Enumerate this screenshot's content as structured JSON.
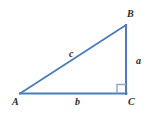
{
  "figure": {
    "type": "right-triangle-diagram",
    "background_color": "#ffffff",
    "stroke_color": "#4a7ebb",
    "label_color": "#2b2b2b",
    "stroke_width": 2,
    "canvas": {
      "width": 158,
      "height": 120
    },
    "vertices": [
      {
        "name": "A",
        "label": "A",
        "x": 20,
        "y": 94
      },
      {
        "name": "B",
        "label": "B",
        "x": 126,
        "y": 25
      },
      {
        "name": "C",
        "label": "C",
        "x": 126,
        "y": 94
      }
    ],
    "sides": [
      {
        "name": "hypotenuse",
        "label": "c",
        "from": "A",
        "to": "B"
      },
      {
        "name": "opposite",
        "label": "a",
        "from": "B",
        "to": "C"
      },
      {
        "name": "adjacent",
        "label": "b",
        "from": "A",
        "to": "C"
      }
    ],
    "right_angle": {
      "at_vertex": "C",
      "marker": "right-angle-square",
      "size": 9
    }
  }
}
